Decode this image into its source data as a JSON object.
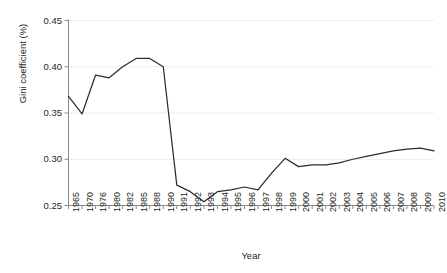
{
  "chart_data": {
    "type": "line",
    "title": "",
    "subtitle": "",
    "xlabel": "Year",
    "ylabel": "Gini coefficient (%)",
    "categories": [
      "1965",
      "1970",
      "1976",
      "1980",
      "1982",
      "1985",
      "1988",
      "1990",
      "1991",
      "1992",
      "1993",
      "1994",
      "1995",
      "1996",
      "1997",
      "1998",
      "1999",
      "2000",
      "2001",
      "2002",
      "2003",
      "2004",
      "2005",
      "2006",
      "2007",
      "2008",
      "2009",
      "2010"
    ],
    "values": [
      0.368,
      0.349,
      0.391,
      0.388,
      0.4,
      0.409,
      0.409,
      0.4,
      0.272,
      0.265,
      0.254,
      0.265,
      0.267,
      0.27,
      0.267,
      0.285,
      0.301,
      0.292,
      0.294,
      0.294,
      0.296,
      0.3,
      0.303,
      0.306,
      0.309,
      0.311,
      0.312,
      0.309
    ],
    "series": [
      {
        "name": "Gini coefficient",
        "color": "#2d2d2d",
        "values": [
          0.368,
          0.349,
          0.391,
          0.388,
          0.4,
          0.409,
          0.409,
          0.4,
          0.272,
          0.265,
          0.254,
          0.265,
          0.267,
          0.27,
          0.267,
          0.285,
          0.301,
          0.292,
          0.294,
          0.294,
          0.296,
          0.3,
          0.303,
          0.306,
          0.309,
          0.311,
          0.312,
          0.309
        ]
      }
    ],
    "yticks": [
      "0.25",
      "0.30",
      "0.35",
      "0.40",
      "0.45"
    ],
    "ytick_values": [
      0.25,
      0.3,
      0.35,
      0.4,
      0.45
    ],
    "ylim": [
      0.25,
      0.45
    ],
    "xlim_index": [
      0,
      27
    ],
    "grid": "horizontal",
    "legend": "none",
    "annotations": []
  },
  "axes": {
    "y_title": "Gini coefficient (%)",
    "x_title": "Year"
  }
}
